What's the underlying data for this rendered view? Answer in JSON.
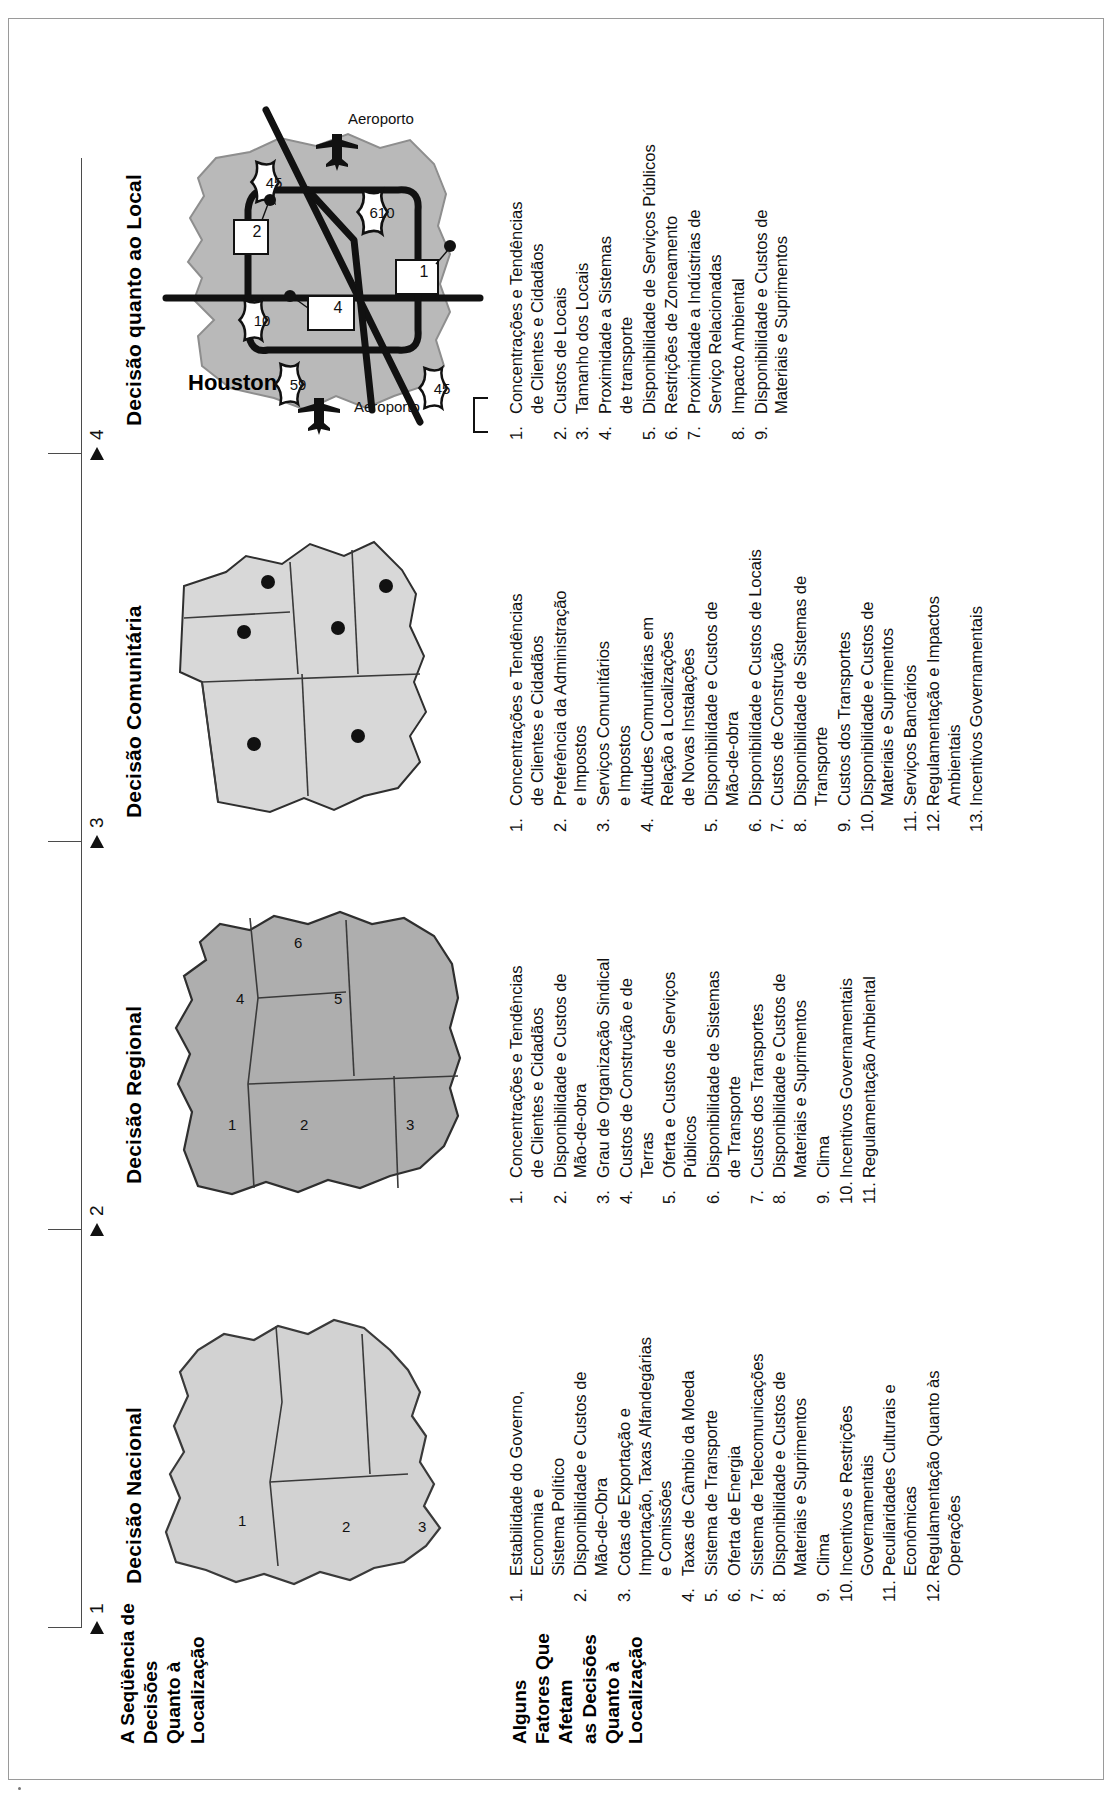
{
  "figure": {
    "sequence_label": "A Seqüência de\nDecisões\nQuanto à\nLocalização",
    "sequence_label_lines": [
      "A Seqüência de",
      "Decisões",
      "Quanto à",
      "Localização"
    ],
    "factors_label_lines": [
      "Alguns",
      "Fatores Que",
      "Afetam",
      "as Decisões",
      "Quanto à",
      "Localização"
    ],
    "steps": [
      "1",
      "2",
      "3",
      "4"
    ]
  },
  "columns": [
    {
      "title": "Decisão Nacional",
      "step": "1",
      "map": {
        "name": "country-map",
        "region_labels": [
          "1",
          "2",
          "3"
        ]
      },
      "factors": [
        {
          "n": "1.",
          "text": "Estabilidade do Governo,\nEconomia e\nSistema Político"
        },
        {
          "n": "2.",
          "text": "Disponibilidade e Custos de\nMão-de-Obra"
        },
        {
          "n": "3.",
          "text": "Cotas de Exportação e\nImportação, Taxas Alfandegárias\ne Comissões"
        },
        {
          "n": "4.",
          "text": "Taxas de Câmbio da Moeda"
        },
        {
          "n": "5.",
          "text": "Sistema de Transporte"
        },
        {
          "n": "6.",
          "text": "Oferta de Energia"
        },
        {
          "n": "7.",
          "text": "Sistema de Telecomunicações"
        },
        {
          "n": "8.",
          "text": "Disponibilidade e Custos de\nMateriais e Suprimentos"
        },
        {
          "n": "9.",
          "text": "Clima"
        },
        {
          "n": "10.",
          "text": "Incentivos e Restrições\nGovernamentais"
        },
        {
          "n": "11.",
          "text": "Peculiaridades Culturais e\nEconômicas"
        },
        {
          "n": "12.",
          "text": "Regulamentação Quanto às\nOperações"
        }
      ]
    },
    {
      "title": "Decisão Regional",
      "step": "2",
      "map": {
        "name": "region-map",
        "region_labels": [
          "1",
          "2",
          "3",
          "4",
          "5",
          "6"
        ]
      },
      "factors": [
        {
          "n": "1.",
          "text": "Concentrações e Tendências\nde Clientes e Cidadãos"
        },
        {
          "n": "2.",
          "text": "Disponibilidade e Custos de\nMão-de-obra"
        },
        {
          "n": "3.",
          "text": "Grau de Organização Sindical"
        },
        {
          "n": "4.",
          "text": "Custos de Construção e de\nTerras"
        },
        {
          "n": "5.",
          "text": "Oferta e Custos de Serviços\nPúblicos"
        },
        {
          "n": "6.",
          "text": "Disponibilidade de Sistemas\nde Transporte"
        },
        {
          "n": "7.",
          "text": "Custos dos Transportes"
        },
        {
          "n": "8.",
          "text": "Disponibilidade e Custos de\nMateriais e Suprimentos"
        },
        {
          "n": "9.",
          "text": "Clima"
        },
        {
          "n": "10.",
          "text": "Incentivos Governamentais"
        },
        {
          "n": "11.",
          "text": "Regulamentação Ambiental"
        }
      ]
    },
    {
      "title": "Decisão Comunitária",
      "step": "3",
      "map": {
        "name": "community-map",
        "region_labels": []
      },
      "factors": [
        {
          "n": "1.",
          "text": "Concentrações e Tendências\nde Clientes e Cidadãos"
        },
        {
          "n": "2.",
          "text": "Preferência da Administração\ne Impostos"
        },
        {
          "n": "3.",
          "text": "Serviços Comunitários\ne Impostos"
        },
        {
          "n": "4.",
          "text": "Atitudes Comunitárias em\nRelação a Localizações\nde Novas Instalações"
        },
        {
          "n": "5.",
          "text": "Disponibilidade e Custos de\nMão-de-obra"
        },
        {
          "n": "6.",
          "text": "Disponibilidade e Custos de Locais"
        },
        {
          "n": "7.",
          "text": "Custos de Construção"
        },
        {
          "n": "8.",
          "text": "Disponibilidade de Sistemas de\nTransporte"
        },
        {
          "n": "9.",
          "text": "Custos dos Transportes"
        },
        {
          "n": "10.",
          "text": "Disponibilidade e Custos de\nMateriais e Suprimentos"
        },
        {
          "n": "11.",
          "text": "Serviços Bancários"
        },
        {
          "n": "12.",
          "text": "Regulamentação e Impactos\nAmbientais"
        },
        {
          "n": "13.",
          "text": "Incentivos Governamentais"
        }
      ]
    },
    {
      "title": "Decisão quanto ao Local",
      "step": "4",
      "map": {
        "name": "city-map",
        "city_name": "Houston",
        "highway_shields": [
          "59",
          "10",
          "45",
          "2",
          "45",
          "610",
          "45"
        ],
        "site_markers": [
          "1",
          "2",
          "3",
          "4"
        ],
        "airport_labels": [
          "Aeroporto",
          "Aeroporto"
        ]
      },
      "factors": [
        {
          "n": "1.",
          "text": "Concentrações e Tendências\nde Clientes e Cidadãos"
        },
        {
          "n": "2.",
          "text": "Custos de Locais"
        },
        {
          "n": "3.",
          "text": "Tamanho dos Locais"
        },
        {
          "n": "4.",
          "text": "Proximidade a Sistemas\nde transporte"
        },
        {
          "n": "5.",
          "text": "Disponibilidade de Serviços Públicos"
        },
        {
          "n": "6.",
          "text": "Restrições de Zoneamento"
        },
        {
          "n": "7.",
          "text": "Proximidade a Indústrias de\nServiço Relacionadas"
        },
        {
          "n": "8.",
          "text": "Impacto Ambiental"
        },
        {
          "n": "9.",
          "text": "Disponibilidade e Custos de\nMateriais e Suprimentos"
        }
      ]
    }
  ],
  "colors": {
    "map_light": "#d2d2d2",
    "map_mid": "#aeaeae",
    "map_city": "#b9b9b9",
    "ink": "#111111",
    "frame": "#9a9a9a"
  }
}
